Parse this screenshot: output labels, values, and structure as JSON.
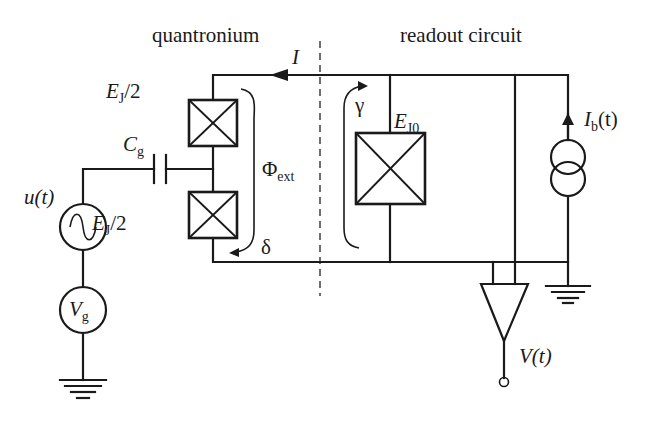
{
  "labels": {
    "quantronium": "quantronium",
    "readout_circuit": "readout circuit",
    "current_I": "I",
    "ej_half_top": {
      "main": "E",
      "sub": "J",
      "suffix": "/2"
    },
    "ej_half_bottom": {
      "main": "E",
      "sub": "J",
      "suffix": "/2"
    },
    "cg": {
      "main": "C",
      "sub": "g"
    },
    "phi_ext": {
      "main": "Φ",
      "sub": "ext"
    },
    "delta": "δ",
    "gamma": "γ",
    "ej0": {
      "main": "E",
      "sub": "J0"
    },
    "ib": {
      "main": "I",
      "sub": "b",
      "suffix": "(t)"
    },
    "u_t": "u(t)",
    "vg": {
      "main": "V",
      "sub": "g"
    },
    "v_t": "V(t)"
  },
  "components": [
    {
      "id": "jj-top",
      "type": "josephson-junction",
      "label": "E_J/2"
    },
    {
      "id": "jj-bottom",
      "type": "josephson-junction",
      "label": "E_J/2"
    },
    {
      "id": "jj-readout",
      "type": "josephson-junction",
      "label": "E_J0"
    },
    {
      "id": "gate-capacitor",
      "type": "capacitor",
      "label": "C_g"
    },
    {
      "id": "ac-source",
      "type": "ac-voltage-source",
      "label": "u(t)"
    },
    {
      "id": "dc-source",
      "type": "voltage-source",
      "label": "V_g"
    },
    {
      "id": "bias-source",
      "type": "current-source",
      "label": "I_b(t)"
    },
    {
      "id": "amplifier",
      "type": "amplifier",
      "label": "V(t)"
    }
  ],
  "colors": {
    "line": "#1a1a1a",
    "background": "#ffffff"
  }
}
